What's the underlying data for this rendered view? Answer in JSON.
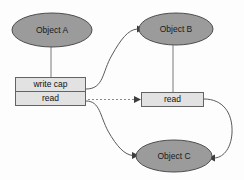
{
  "diagram": {
    "background_color": "#fdfdfd",
    "colors": {
      "ellipse_fill": "#9b9b9b",
      "ellipse_stroke": "#4d4d4d",
      "box_fill": "#e2e2e2",
      "box_stroke": "#636363",
      "edge_stroke": "#5a5a5a",
      "dashed_edge_stroke": "#8a8a8a",
      "arrow_fill": "#3d3d3d",
      "text_color": "#1a1a1a"
    },
    "nodes": [
      {
        "id": "object-a",
        "label": "Object A",
        "shape": "ellipse",
        "cx": 52,
        "cy": 30,
        "rx": 40,
        "ry": 17
      },
      {
        "id": "object-b",
        "label": "Object B",
        "shape": "ellipse",
        "cx": 176,
        "cy": 29,
        "rx": 37,
        "ry": 16
      },
      {
        "id": "object-c",
        "label": "Object C",
        "shape": "ellipse",
        "cx": 174,
        "cy": 156,
        "rx": 38,
        "ry": 16
      }
    ],
    "capability_table": {
      "id": "capability-table-a",
      "x": 15,
      "y": 77,
      "width": 71,
      "height": 29,
      "rows": [
        {
          "id": "write-cap-row",
          "label": "write cap"
        },
        {
          "id": "read-row",
          "label": "read"
        }
      ]
    },
    "capability_box_b": {
      "id": "capability-box-b",
      "label": "read",
      "x": 141,
      "y": 92,
      "width": 63,
      "height": 15
    },
    "edges": [
      {
        "id": "edge-a-to-caps",
        "style": "solid",
        "from": "object-a",
        "to": "capability-table-a",
        "arrow": false
      },
      {
        "id": "edge-writecap-to-b",
        "style": "solid",
        "from": "write-cap-row",
        "to": "object-b",
        "arrow": true
      },
      {
        "id": "edge-read-to-readb",
        "style": "dashed",
        "from": "read-row",
        "to": "capability-box-b",
        "arrow": true
      },
      {
        "id": "edge-read-to-c",
        "style": "solid",
        "from": "read-row",
        "to": "object-c",
        "arrow": true
      },
      {
        "id": "edge-b-to-readb",
        "style": "solid",
        "from": "object-b",
        "to": "capability-box-b",
        "arrow": false
      },
      {
        "id": "edge-readb-to-c",
        "style": "solid",
        "from": "capability-box-b",
        "to": "object-c",
        "arrow": true
      }
    ]
  }
}
